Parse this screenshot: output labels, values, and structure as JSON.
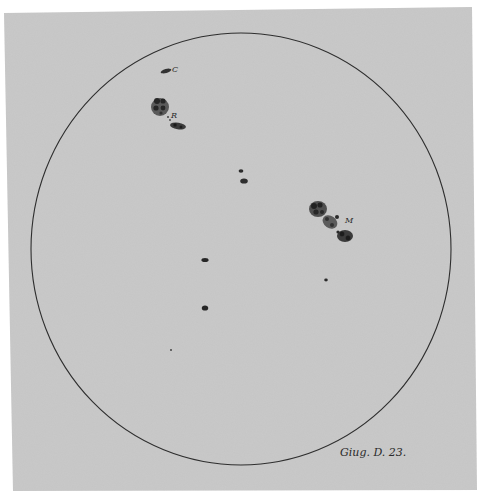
{
  "sheet": {
    "color": "#c8c8c8",
    "corners": "4,13 472,7 477,490 13,491"
  },
  "disk": {
    "cx": 241,
    "cy": 249,
    "rx": 210,
    "ry": 216,
    "stroke": "#2e2e2e"
  },
  "spots": [
    {
      "id": "C",
      "label": "C",
      "label_x": 172,
      "label_y": 72
    },
    {
      "id": "R",
      "label": "R",
      "label_x": 171,
      "label_y": 117
    },
    {
      "id": "M",
      "label": "M",
      "label_x": 345,
      "label_y": 222
    }
  ],
  "caption": "Giug. D. 23."
}
